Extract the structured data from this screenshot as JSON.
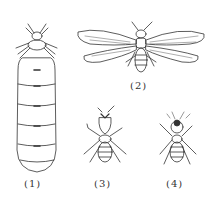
{
  "figures": [
    {
      "id": "1",
      "label": "(1)",
      "subject": "queen"
    },
    {
      "id": "2",
      "label": "(2)",
      "subject": "winged-reproductive"
    },
    {
      "id": "3",
      "label": "(3)",
      "subject": "soldier"
    },
    {
      "id": "4",
      "label": "(4)",
      "subject": "worker"
    }
  ],
  "colors": {
    "ink": "#333333",
    "background": "#ffffff"
  }
}
